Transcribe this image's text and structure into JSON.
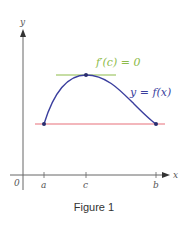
{
  "figure": {
    "caption": "Figure 1",
    "axes": {
      "x_label": "x",
      "y_label": "y",
      "origin_label": "0",
      "x_ticks": [
        {
          "label": "a",
          "px": 44
        },
        {
          "label": "c",
          "px": 86
        },
        {
          "label": "b",
          "px": 156
        }
      ]
    },
    "curve": {
      "label": "y = f(x)",
      "color": "#3b3f9e"
    },
    "tangent": {
      "label": "f′(c) = 0",
      "color": "#8dbb4a"
    },
    "secant": {
      "color": "#e8707a"
    },
    "points": [
      {
        "name": "a-endpoint",
        "label": "(a, f(a))"
      },
      {
        "name": "c-peak",
        "label": "(c, f(c))"
      },
      {
        "name": "b-endpoint",
        "label": "(b, f(b))"
      }
    ],
    "colors": {
      "axis": "#555555",
      "text": "#444444",
      "point": "#2a2d6e"
    }
  }
}
